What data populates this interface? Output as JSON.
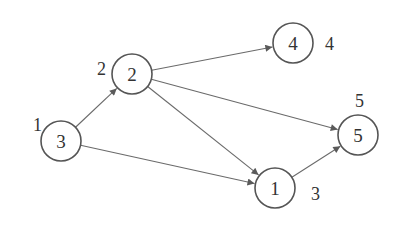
{
  "diagram": {
    "type": "directed-graph",
    "nodes": [
      {
        "id": "n3",
        "label": "3",
        "order_label": "1",
        "cx": 61,
        "cy": 141,
        "r": 20,
        "label_x": 33,
        "label_y": 131
      },
      {
        "id": "n2",
        "label": "2",
        "order_label": "2",
        "cx": 132,
        "cy": 74,
        "r": 20,
        "label_x": 97,
        "label_y": 75
      },
      {
        "id": "n4",
        "label": "4",
        "order_label": "4",
        "cx": 293,
        "cy": 43,
        "r": 20,
        "label_x": 325,
        "label_y": 50
      },
      {
        "id": "n5",
        "label": "5",
        "order_label": "5",
        "cx": 358,
        "cy": 135,
        "r": 20,
        "label_x": 355,
        "label_y": 107
      },
      {
        "id": "n1",
        "label": "1",
        "order_label": "3",
        "cx": 275,
        "cy": 188,
        "r": 20,
        "label_x": 311,
        "label_y": 200
      }
    ],
    "edges": [
      {
        "from": "n3",
        "to": "n2"
      },
      {
        "from": "n3",
        "to": "n1"
      },
      {
        "from": "n2",
        "to": "n4"
      },
      {
        "from": "n2",
        "to": "n5"
      },
      {
        "from": "n2",
        "to": "n1"
      },
      {
        "from": "n1",
        "to": "n5"
      }
    ],
    "colors": {
      "node_stroke": "#555555",
      "edge": "#6a6a6a",
      "text": "#333333",
      "background": "#ffffff"
    }
  }
}
